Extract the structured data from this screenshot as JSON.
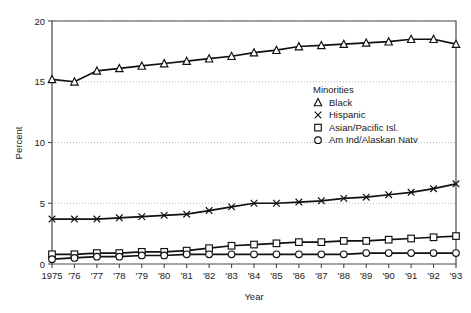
{
  "chart_data": {
    "type": "line",
    "title": "",
    "xlabel": "Year",
    "ylabel": "Percent",
    "ylim": [
      0,
      20
    ],
    "yticks": [
      0,
      5,
      10,
      15,
      20
    ],
    "grid": true,
    "legend_position": "center-right-inside",
    "legend_title": "Minorities",
    "categories": [
      "1975",
      "'76",
      "'77",
      "'78",
      "'79",
      "'80",
      "'81",
      "'82",
      "'83",
      "'84",
      "'85",
      "'86",
      "'87",
      "'88",
      "'89",
      "'90",
      "'91",
      "'92",
      "'93"
    ],
    "x": [
      1975,
      1976,
      1977,
      1978,
      1979,
      1980,
      1981,
      1982,
      1983,
      1984,
      1985,
      1986,
      1987,
      1988,
      1989,
      1990,
      1991,
      1992,
      1993
    ],
    "series": [
      {
        "name": "Black",
        "marker": "triangle",
        "values": [
          15.2,
          15.0,
          15.9,
          16.1,
          16.3,
          16.5,
          16.7,
          16.9,
          17.1,
          17.4,
          17.6,
          17.9,
          18.0,
          18.1,
          18.2,
          18.3,
          18.5,
          18.5,
          18.1
        ]
      },
      {
        "name": "Hispanic",
        "marker": "x",
        "values": [
          3.7,
          3.7,
          3.7,
          3.8,
          3.9,
          4.0,
          4.1,
          4.4,
          4.7,
          5.0,
          5.0,
          5.1,
          5.2,
          5.4,
          5.5,
          5.7,
          5.9,
          6.2,
          6.6
        ]
      },
      {
        "name": "Asian/Pacific Isl.",
        "marker": "square",
        "values": [
          0.8,
          0.8,
          0.9,
          0.9,
          1.0,
          1.0,
          1.1,
          1.3,
          1.5,
          1.6,
          1.7,
          1.8,
          1.8,
          1.9,
          1.9,
          2.0,
          2.1,
          2.2,
          2.3
        ]
      },
      {
        "name": "Am Ind/Alaskan Natv",
        "marker": "circle",
        "values": [
          0.4,
          0.5,
          0.6,
          0.6,
          0.7,
          0.7,
          0.8,
          0.8,
          0.8,
          0.8,
          0.8,
          0.8,
          0.8,
          0.8,
          0.9,
          0.9,
          0.9,
          0.9,
          0.9
        ]
      }
    ]
  },
  "legend": {
    "title": "Minorities",
    "items": [
      {
        "label": "Black",
        "marker": "triangle-icon"
      },
      {
        "label": "Hispanic",
        "marker": "x-icon"
      },
      {
        "label": "Asian/Pacific Isl.",
        "marker": "square-icon"
      },
      {
        "label": "Am Ind/Alaskan Natv",
        "marker": "circle-icon"
      }
    ]
  },
  "axes": {
    "y_title": "Percent",
    "x_title": "Year",
    "y_tick_labels": [
      "0",
      "5",
      "10",
      "15",
      "20"
    ],
    "x_tick_labels": [
      "1975",
      "'76",
      "'77",
      "'78",
      "'79",
      "'80",
      "'81",
      "'82",
      "'83",
      "'84",
      "'85",
      "'86",
      "'87",
      "'88",
      "'89",
      "'90",
      "'91",
      "'92",
      "'93"
    ]
  },
  "colors": {
    "line": "#111111",
    "axis": "#4a4a4a",
    "grid": "#9a9a9a",
    "background": "#ffffff"
  }
}
